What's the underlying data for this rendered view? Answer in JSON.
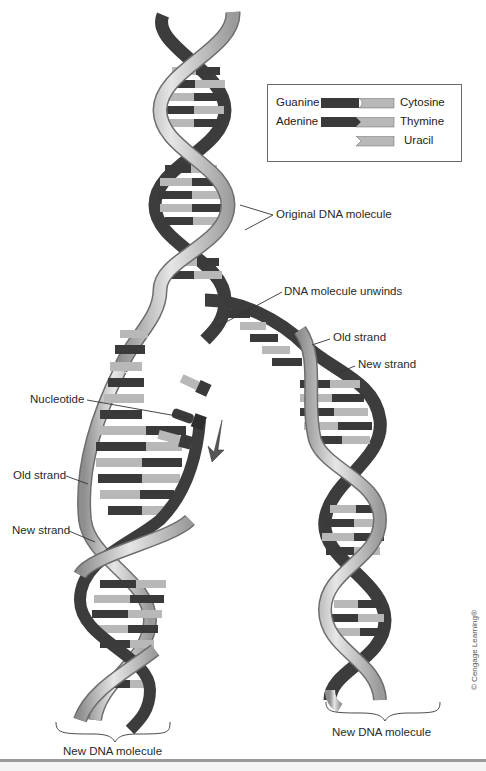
{
  "figure": {
    "legend": {
      "rows": [
        {
          "left": "Guanine",
          "right": "Cytosine",
          "left_color": "#3a3a3a",
          "right_color": "#b8b8b8"
        },
        {
          "left": "Adenine",
          "right": "Thymine",
          "left_color": "#3a3a3a",
          "right_color": "#b8b8b8"
        },
        {
          "left": "",
          "right": "Uracil",
          "left_color": "",
          "right_color": "#b8b8b8"
        }
      ]
    },
    "labels": {
      "original_dna": "Original DNA molecule",
      "unwinds": "DNA molecule unwinds",
      "old_strand_right": "Old strand",
      "new_strand_right": "New strand",
      "nucleotide": "Nucleotide",
      "old_strand_left": "Old strand",
      "new_strand_left": "New strand",
      "new_dna_left": "New DNA molecule",
      "new_dna_right": "New DNA molecule"
    },
    "credit": "© Cengage Learning®",
    "colors": {
      "backbone_light": "#c8c8c8",
      "backbone_dark": "#3c3c3c",
      "base_dark": "#3a3a3a",
      "base_light": "#b8b8b8",
      "leader_line": "#333333"
    }
  }
}
